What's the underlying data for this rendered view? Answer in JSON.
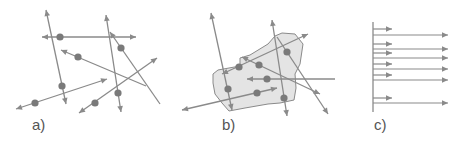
{
  "colors": {
    "line": "#8a8a8a",
    "dot": "#7a7a7a",
    "region_fill": "#e4e4e4",
    "region_stroke": "#8a8a8a",
    "label": "#555555"
  },
  "panels": [
    {
      "id": "a",
      "label": "a)",
      "label_pos": [
        32,
        132
      ],
      "rays": [
        {
          "from": [
            66,
            104
          ],
          "to": [
            46,
            10
          ],
          "start_arrow": true,
          "end_arrow": true,
          "dot": [
            62,
            86
          ]
        },
        {
          "from": [
            42,
            37
          ],
          "to": [
            136,
            37
          ],
          "start_arrow": true,
          "end_arrow": true,
          "dot": [
            60,
            37
          ]
        },
        {
          "from": [
            121,
            112
          ],
          "to": [
            106,
            15
          ],
          "start_arrow": true,
          "end_arrow": true,
          "dot": [
            118,
            93
          ]
        },
        {
          "from": [
            160,
            104
          ],
          "to": [
            110,
            32
          ],
          "start_arrow": false,
          "end_arrow": true,
          "dot": [
            121,
            48
          ]
        },
        {
          "from": [
            146,
            86
          ],
          "to": [
            61,
            50
          ],
          "start_arrow": false,
          "end_arrow": true,
          "dot": [
            78,
            57
          ]
        },
        {
          "from": [
            16,
            109
          ],
          "to": [
            107,
            79
          ],
          "start_arrow": true,
          "end_arrow": true,
          "dot": [
            35,
            103
          ]
        },
        {
          "from": [
            79,
            113
          ],
          "to": [
            157,
            58
          ],
          "start_arrow": true,
          "end_arrow": true,
          "dot": [
            95,
            103
          ]
        }
      ]
    },
    {
      "id": "b",
      "label": "b)",
      "label_pos": [
        222,
        132
      ],
      "region": [
        [
          218,
          70
        ],
        [
          240,
          66
        ],
        [
          240,
          58
        ],
        [
          250,
          55
        ],
        [
          268,
          44
        ],
        [
          275,
          36
        ],
        [
          282,
          33
        ],
        [
          295,
          34
        ],
        [
          303,
          44
        ],
        [
          300,
          64
        ],
        [
          295,
          74
        ],
        [
          296,
          88
        ],
        [
          294,
          100
        ],
        [
          280,
          103
        ],
        [
          268,
          104
        ],
        [
          245,
          108
        ],
        [
          229,
          111
        ],
        [
          222,
          103
        ],
        [
          215,
          94
        ],
        [
          213,
          83
        ],
        [
          213,
          74
        ]
      ],
      "rays": [
        {
          "from": [
            232,
            110
          ],
          "to": [
            211,
            13
          ],
          "start_arrow": true,
          "end_arrow": true,
          "dot": [
            228,
            89
          ]
        },
        {
          "from": [
            287,
            116
          ],
          "to": [
            272,
            20
          ],
          "start_arrow": true,
          "end_arrow": true,
          "dot": [
            284,
            98
          ]
        },
        {
          "from": [
            277,
            37
          ],
          "to": [
            328,
            114
          ],
          "start_arrow": false,
          "end_arrow": true,
          "dot": [
            287,
            52
          ]
        },
        {
          "from": [
            182,
            110
          ],
          "to": [
            277,
            88
          ],
          "start_arrow": true,
          "end_arrow": true,
          "dot": [
            257,
            93
          ]
        },
        {
          "from": [
            222,
            74
          ],
          "to": [
            308,
            34
          ],
          "start_arrow": true,
          "end_arrow": true,
          "dot": [
            239,
            67
          ]
        },
        {
          "from": [
            242,
            57
          ],
          "to": [
            320,
            94
          ],
          "start_arrow": true,
          "end_arrow": true,
          "dot": [
            259,
            65
          ]
        },
        {
          "from": [
            335,
            79
          ],
          "to": [
            247,
            79
          ],
          "start_arrow": false,
          "end_arrow": true,
          "dot": [
            267,
            79
          ]
        }
      ]
    },
    {
      "id": "c",
      "label": "c)",
      "label_pos": [
        374,
        132
      ],
      "baseline": {
        "x": 373,
        "y1": 22,
        "y2": 112
      },
      "arrows": [
        {
          "y": 29,
          "to_x": 392
        },
        {
          "y": 35,
          "to_x": 448
        },
        {
          "y": 44,
          "to_x": 392
        },
        {
          "y": 49,
          "to_x": 448
        },
        {
          "y": 53,
          "to_x": 392
        },
        {
          "y": 58,
          "to_x": 448
        },
        {
          "y": 64,
          "to_x": 392
        },
        {
          "y": 69,
          "to_x": 448
        },
        {
          "y": 75,
          "to_x": 392
        },
        {
          "y": 80,
          "to_x": 448
        },
        {
          "y": 98,
          "to_x": 392
        },
        {
          "y": 103,
          "to_x": 448
        }
      ]
    }
  ]
}
